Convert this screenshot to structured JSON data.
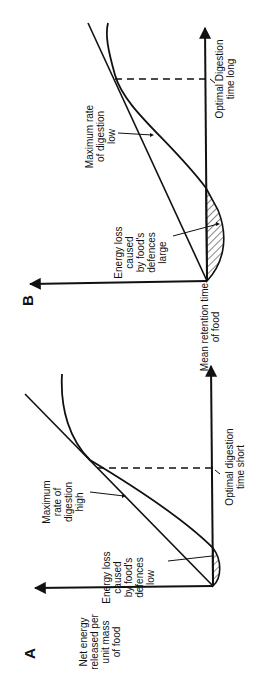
{
  "figure": {
    "panels": [
      {
        "id": "A",
        "label": "A",
        "y_axis_label": "Net energy\nreleased per\nunit mass\nof food",
        "max_rate_label": "Maximum\nrate of\ndigestion\nhigh",
        "energy_loss_label": "Energy loss\ncaused\nby food's\ndefences\nlow",
        "optimal_label": "Optimal digestion\ntime short"
      },
      {
        "id": "B",
        "label": "B",
        "x_axis_label": "Mean retention time\nof food",
        "max_rate_label": "Maximum rate\nof digestion\nlow",
        "energy_loss_label": "Energy loss\ncaused\nby food's\ndefences\nlarge",
        "optimal_label": "Optimal Digestion\ntime long"
      }
    ],
    "colors": {
      "ink": "#111111",
      "background": "#ffffff"
    }
  }
}
